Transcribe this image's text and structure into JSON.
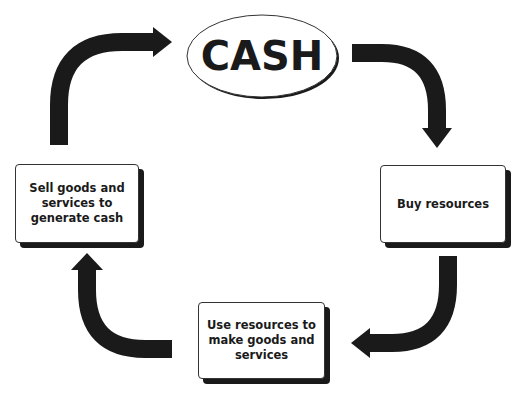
{
  "diagram": {
    "center_node": {
      "label": "CASH",
      "shape": "ellipse"
    },
    "nodes": [
      {
        "id": "sell",
        "label": "Sell goods and services to generate cash",
        "lines": [
          "Sell goods and",
          "services to",
          "generate cash"
        ],
        "position": "left"
      },
      {
        "id": "buy",
        "label": "Buy resources",
        "lines": [
          "Buy resources"
        ],
        "position": "right"
      },
      {
        "id": "use",
        "label": "Use resources to make goods and services",
        "lines": [
          "Use resources to",
          "make goods and",
          "services"
        ],
        "position": "bottom"
      }
    ],
    "edges": [
      {
        "from": "CASH",
        "to": "buy",
        "icon": "curved-arrow-down-right"
      },
      {
        "from": "buy",
        "to": "use",
        "icon": "curved-arrow-down-left"
      },
      {
        "from": "use",
        "to": "sell",
        "icon": "curved-arrow-up-left"
      },
      {
        "from": "sell",
        "to": "CASH",
        "icon": "curved-arrow-up-right"
      }
    ],
    "colors": {
      "arrow": "#1a1a1a",
      "box_border": "#333333",
      "shadow": "#1a1a1a",
      "background": "#ffffff"
    }
  }
}
